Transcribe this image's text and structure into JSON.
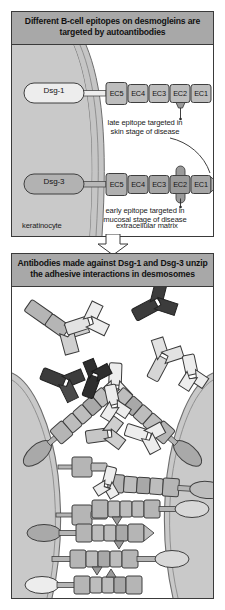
{
  "figure": {
    "title_implicit": "B-cell epitopes on desmogleins and antibody-mediated desmosome unzipping",
    "background_color": "#ffffff"
  },
  "colors": {
    "header_band": "#a8a8a8",
    "panel_border": "#3a3a3a",
    "cytoplasm": "#c9c9c9",
    "membrane": "#bdbdbd",
    "ec_light": "#bdbdbd",
    "ec_dark": "#9a9a9a",
    "antibody_light": "#e2e2e2",
    "antibody_mid": "#b5b5b5",
    "antibody_dark": "#3c3c3c",
    "extracellular_matrix": "#ffffff",
    "text": "#141414"
  },
  "panel_top": {
    "id": "epitope-panel",
    "header": "Different B-cell epitopes on desmogleins are targeted by autoantibodies",
    "header_lines": [
      "Different B-cell epitopes on desmogleins are",
      "targeted by autoantibodies"
    ],
    "compartments": [
      {
        "name": "keratinocyte",
        "label": "keratinocyte"
      },
      {
        "name": "extracellular-matrix",
        "label": "extracellular matrix"
      }
    ],
    "molecules": [
      {
        "name": "Dsg-1",
        "label": "Dsg-1",
        "shade": "light",
        "domains": [
          "EC5",
          "EC4",
          "EC3",
          "EC2",
          "EC1"
        ],
        "epitope_domain": "EC2",
        "epitope_side": "below"
      },
      {
        "name": "Dsg-3",
        "label": "Dsg-3",
        "shade": "dark",
        "domains": [
          "EC5",
          "EC4",
          "EC3",
          "EC2",
          "EC1"
        ],
        "epitope_domain": "EC2",
        "epitope_side": "both"
      }
    ],
    "annotations": [
      {
        "name": "late-epitope-annotation",
        "lines": [
          "late epitope targeted in",
          "skin stage of disease"
        ],
        "text": "late epitope targeted in skin stage of disease",
        "points_to": "Dsg-1 EC2"
      },
      {
        "name": "early-epitope-annotation",
        "lines": [
          "early epitope targeted in",
          "mucosal stage of disease"
        ],
        "text": "early epitope targeted in mucosal stage of disease",
        "points_to": "Dsg-3 EC2"
      }
    ]
  },
  "panel_bottom": {
    "id": "unzipping-panel",
    "header": "Antibodies made against Dsg-1 and Dsg-3 unzip the adhesive interactions in desmosomes",
    "header_lines": [
      "Antibodies made against Dsg-1 and Dsg-3 unzip",
      "the adhesive interactions in desmosomes"
    ],
    "elements": [
      {
        "name": "antibody-light",
        "description": "Y-shaped IgG autoantibody, light shade (anti-Dsg-1)",
        "count": 8
      },
      {
        "name": "antibody-dark",
        "description": "Y-shaped IgG autoantibody, dark shade (anti-Dsg-3)",
        "count": 5
      },
      {
        "name": "desmoglein-chain",
        "description": "EC1-EC5 desmoglein ectodomain chain anchored in keratinocyte membrane",
        "count": 10
      },
      {
        "name": "keratinocyte-membrane",
        "description": "opposing keratinocyte cell membranes forming the desmosome",
        "count": 2
      }
    ],
    "zones": [
      {
        "name": "free-antibodies-zone",
        "description": "unbound autoantibodies above the desmosome"
      },
      {
        "name": "unzipped-zone",
        "description": "separated desmoglein chains with bound antibodies"
      },
      {
        "name": "zipped-zone",
        "description": "intact interdigitated desmoglein zipper"
      }
    ]
  },
  "flow": {
    "name": "flow-arrow",
    "direction": "down",
    "from": "panel_top",
    "to": "panel_bottom"
  }
}
